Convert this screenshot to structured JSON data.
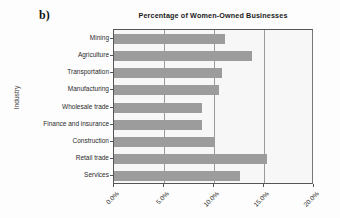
{
  "panel": {
    "letter": "b)"
  },
  "chart_data": {
    "type": "bar",
    "orientation": "horizontal",
    "title": "Percentage of Women-Owned Businesses",
    "subtitle": "",
    "xlabel": "",
    "ylabel": "Industry",
    "categories": [
      "Mining",
      "Agriculture",
      "Transportation",
      "Manufacturing",
      "Wholesale trade",
      "Finance and insurance",
      "Construction",
      "Retail trade",
      "Services"
    ],
    "values": [
      11.1,
      13.8,
      10.8,
      10.5,
      8.8,
      8.8,
      10.1,
      15.3,
      12.6
    ],
    "value_labels": [
      "11.1%",
      "13.8%",
      "10.8%",
      "10.5%",
      "8.8%",
      "8.8%",
      "10.1%",
      "15.3%",
      "12.6%"
    ],
    "xlim": [
      0,
      20
    ],
    "xticks": [
      0,
      5,
      10,
      15,
      20
    ],
    "xtick_labels": [
      "0.0%",
      "5.0%",
      "10.0%",
      "15.0%",
      "20.0%"
    ],
    "grid": true,
    "grid_axis": "x",
    "legend": false,
    "legend_position": "none",
    "bar_color": "#9c9c9c",
    "plot_background": "#f7f7f7",
    "axis_color": "#555555",
    "gridline_color": "#9a9a9a"
  }
}
